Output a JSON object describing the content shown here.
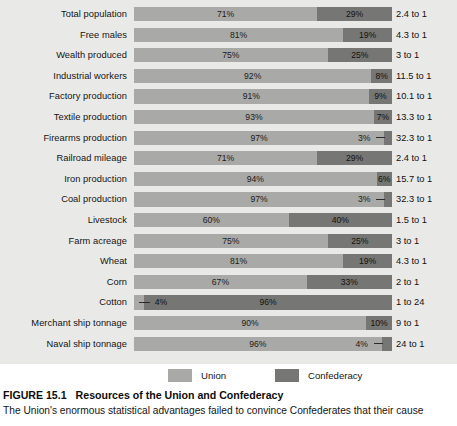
{
  "figure": {
    "number": "FIGURE 15.1",
    "title": "Resources of the Union and Confederacy",
    "body": "The Union's enormous statistical advantages failed to convince Confederates that their cause"
  },
  "legend": {
    "union": {
      "label": "Union",
      "color": "#a9a9a7"
    },
    "confederacy": {
      "label": "Confederacy",
      "color": "#767674"
    }
  },
  "chart_data": {
    "type": "bar",
    "subtype": "stacked-horizontal-100pct",
    "title": "Resources of the Union and Confederacy",
    "xlabel": "",
    "ylabel": "",
    "xlim": [
      0,
      100
    ],
    "grid": false,
    "legend_position": "bottom",
    "categories": [
      "Total population",
      "Free males",
      "Wealth produced",
      "Industrial workers",
      "Factory production",
      "Textile production",
      "Firearms production",
      "Railroad mileage",
      "Iron production",
      "Coal production",
      "Livestock",
      "Farm acreage",
      "Wheat",
      "Corn",
      "Cotton",
      "Merchant ship tonnage",
      "Naval ship tonnage"
    ],
    "series": [
      {
        "name": "Union",
        "values": [
          71,
          81,
          75,
          92,
          91,
          93,
          97,
          71,
          94,
          97,
          60,
          75,
          81,
          67,
          4,
          90,
          96
        ]
      },
      {
        "name": "Confederacy",
        "values": [
          29,
          19,
          25,
          8,
          9,
          7,
          3,
          29,
          6,
          3,
          40,
          25,
          19,
          33,
          96,
          10,
          4
        ]
      }
    ],
    "rows": [
      {
        "label": "Total population",
        "union": 71,
        "confederacy": 29,
        "union_label": "71%",
        "conf_label": "29%",
        "ratio": "2.4 to 1",
        "leader": "none"
      },
      {
        "label": "Free males",
        "union": 81,
        "confederacy": 19,
        "union_label": "81%",
        "conf_label": "19%",
        "ratio": "4.3 to 1",
        "leader": "none"
      },
      {
        "label": "Wealth produced",
        "union": 75,
        "confederacy": 25,
        "union_label": "75%",
        "conf_label": "25%",
        "ratio": "3 to 1",
        "leader": "none"
      },
      {
        "label": "Industrial workers",
        "union": 92,
        "confederacy": 8,
        "union_label": "92%",
        "conf_label": "8%",
        "ratio": "11.5 to 1",
        "leader": "none"
      },
      {
        "label": "Factory production",
        "union": 91,
        "confederacy": 9,
        "union_label": "91%",
        "conf_label": "9%",
        "ratio": "10.1 to 1",
        "leader": "none"
      },
      {
        "label": "Textile production",
        "union": 93,
        "confederacy": 7,
        "union_label": "93%",
        "conf_label": "7%",
        "ratio": "13.3 to 1",
        "leader": "none"
      },
      {
        "label": "Firearms production",
        "union": 97,
        "confederacy": 3,
        "union_label": "97%",
        "conf_label": "3%",
        "ratio": "32.3 to 1",
        "leader": "right"
      },
      {
        "label": "Railroad mileage",
        "union": 71,
        "confederacy": 29,
        "union_label": "71%",
        "conf_label": "29%",
        "ratio": "2.4 to 1",
        "leader": "none"
      },
      {
        "label": "Iron production",
        "union": 94,
        "confederacy": 6,
        "union_label": "94%",
        "conf_label": "6%",
        "ratio": "15.7 to 1",
        "leader": "none"
      },
      {
        "label": "Coal production",
        "union": 97,
        "confederacy": 3,
        "union_label": "97%",
        "conf_label": "3%",
        "ratio": "32.3 to 1",
        "leader": "right"
      },
      {
        "label": "Livestock",
        "union": 60,
        "confederacy": 40,
        "union_label": "60%",
        "conf_label": "40%",
        "ratio": "1.5 to 1",
        "leader": "none"
      },
      {
        "label": "Farm acreage",
        "union": 75,
        "confederacy": 25,
        "union_label": "75%",
        "conf_label": "25%",
        "ratio": "3 to 1",
        "leader": "none"
      },
      {
        "label": "Wheat",
        "union": 81,
        "confederacy": 19,
        "union_label": "81%",
        "conf_label": "19%",
        "ratio": "4.3 to 1",
        "leader": "none"
      },
      {
        "label": "Corn",
        "union": 67,
        "confederacy": 33,
        "union_label": "67%",
        "conf_label": "33%",
        "ratio": "2 to 1",
        "leader": "none"
      },
      {
        "label": "Cotton",
        "union": 4,
        "confederacy": 96,
        "union_label": "4%",
        "conf_label": "96%",
        "ratio": "1 to 24",
        "leader": "left"
      },
      {
        "label": "Merchant ship tonnage",
        "union": 90,
        "confederacy": 10,
        "union_label": "90%",
        "conf_label": "10%",
        "ratio": "9 to 1",
        "leader": "none"
      },
      {
        "label": "Naval ship tonnage",
        "union": 96,
        "confederacy": 4,
        "union_label": "96%",
        "conf_label": "4%",
        "ratio": "24 to 1",
        "leader": "right"
      }
    ]
  }
}
